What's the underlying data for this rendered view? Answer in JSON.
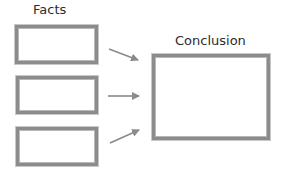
{
  "diagram": {
    "facts_title": "Facts",
    "conclusion_title": "Conclusion",
    "facts": [
      {
        "id": "fact-1",
        "text": ""
      },
      {
        "id": "fact-2",
        "text": ""
      },
      {
        "id": "fact-3",
        "text": ""
      }
    ],
    "conclusion": {
      "text": ""
    },
    "colors": {
      "box_border": "#8c8c8c",
      "arrow": "#8a8a8a",
      "text": "#2b2b2b"
    }
  }
}
